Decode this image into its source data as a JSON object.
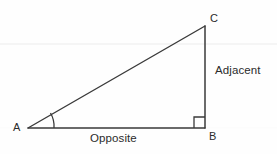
{
  "diagram": {
    "type": "right-triangle",
    "background_color": "#fefefe",
    "stroke_color": "#3a3a3a",
    "text_color": "#2b2b2b",
    "artifact_line_color": "#f2f2f2",
    "vertices": [
      {
        "id": "A",
        "label": "A",
        "x": 28,
        "y": 128,
        "label_x": 13,
        "label_y": 122
      },
      {
        "id": "B",
        "label": "B",
        "x": 205,
        "y": 128,
        "label_x": 209,
        "label_y": 131
      },
      {
        "id": "C",
        "label": "C",
        "x": 205,
        "y": 26,
        "label_x": 210,
        "label_y": 13
      }
    ],
    "sides": [
      {
        "id": "opposite",
        "label": "Opposite",
        "from": "A",
        "to": "B",
        "orientation": "horizontal",
        "label_x": 90,
        "label_y": 133
      },
      {
        "id": "adjacent",
        "label": "Adjacent",
        "from": "B",
        "to": "C",
        "orientation": "vertical",
        "label_x": 215,
        "label_y": 65
      },
      {
        "id": "hypotenuse",
        "label": "",
        "from": "A",
        "to": "C",
        "orientation": "diagonal",
        "label_x": null,
        "label_y": null
      }
    ],
    "markers": {
      "angle_arc": {
        "at_vertex": "A",
        "radius": 26,
        "description": "angle-arc-at-a"
      },
      "right_angle": {
        "at_vertex": "B",
        "size": 11,
        "description": "right-angle-marker-at-b"
      }
    }
  }
}
